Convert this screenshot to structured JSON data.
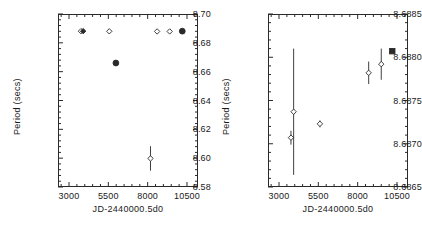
{
  "figure": {
    "background": "#ffffff",
    "foreground": "#2a2a2a"
  },
  "chart_data": [
    {
      "type": "scatter",
      "panel": "left",
      "title": "",
      "xlabel": "JD-2440000.5d0",
      "ylabel": "Period (secs)",
      "xlim": [
        2300,
        11200
      ],
      "ylim": [
        8.58,
        8.7
      ],
      "xticks": [
        3000,
        5500,
        8000,
        10500
      ],
      "yticks": [
        8.58,
        8.6,
        8.62,
        8.64,
        8.66,
        8.68,
        8.7
      ],
      "xticklabels": [
        "3000",
        "5500",
        "8000",
        "10500"
      ],
      "yticklabels": [
        "8.58",
        "8.60",
        "8.62",
        "8.64",
        "8.66",
        "8.68",
        "8.70"
      ],
      "grid": false,
      "legend": false,
      "points": [
        {
          "x": 3760,
          "y": 8.6881,
          "yerr": 0.0,
          "marker": "diamond-open"
        },
        {
          "x": 3900,
          "y": 8.6881,
          "yerr": 0.0,
          "marker": "diamond-filled"
        },
        {
          "x": 5560,
          "y": 8.688,
          "yerr": 0.0,
          "marker": "diamond-open"
        },
        {
          "x": 5980,
          "y": 8.666,
          "yerr": 0.0,
          "marker": "circle-filled"
        },
        {
          "x": 8600,
          "y": 8.6879,
          "yerr": 0.0,
          "marker": "diamond-open"
        },
        {
          "x": 9400,
          "y": 8.6879,
          "yerr": 0.0,
          "marker": "diamond-open"
        },
        {
          "x": 8180,
          "y": 8.5998,
          "yerr": 0.0085,
          "marker": "diamond-open"
        },
        {
          "x": 10200,
          "y": 8.6881,
          "yerr": 0.0,
          "marker": "circle-filled"
        }
      ]
    },
    {
      "type": "scatter",
      "panel": "right",
      "title": "",
      "xlabel": "JD-2440000.5d0",
      "ylabel": "Period (secs)",
      "xlim": [
        2300,
        11200
      ],
      "ylim": [
        8.6865,
        8.6885
      ],
      "xticks": [
        3000,
        5500,
        8000,
        10500
      ],
      "yticks": [
        8.6865,
        8.687,
        8.6875,
        8.688,
        8.6885
      ],
      "xticklabels": [
        "3000",
        "5500",
        "8000",
        "10500"
      ],
      "yticklabels": [
        "8.6865",
        "8.6870",
        "8.6875",
        "8.6880",
        "8.6885"
      ],
      "grid": false,
      "legend": false,
      "points": [
        {
          "x": 3760,
          "y": 8.68707,
          "yerr": 8e-05,
          "marker": "diamond-open"
        },
        {
          "x": 3930,
          "y": 8.68737,
          "yerr": 0.00073,
          "marker": "diamond-open"
        },
        {
          "x": 5600,
          "y": 8.68723,
          "yerr": 4e-05,
          "marker": "diamond-open"
        },
        {
          "x": 8700,
          "y": 8.68782,
          "yerr": 0.00013,
          "marker": "diamond-open"
        },
        {
          "x": 9500,
          "y": 8.68792,
          "yerr": 0.00018,
          "marker": "diamond-open"
        },
        {
          "x": 10200,
          "y": 8.68807,
          "yerr": 0.0,
          "marker": "square-filled"
        }
      ]
    }
  ]
}
